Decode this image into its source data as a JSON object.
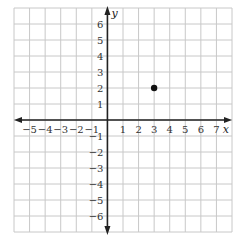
{
  "chart_data": {
    "type": "scatter",
    "title": "",
    "xlabel": "x",
    "ylabel": "y",
    "xlim": [
      -6,
      8
    ],
    "ylim": [
      -7,
      7
    ],
    "grid": true,
    "x_tick_labels": [
      "−5",
      "−4",
      "−3",
      "−2",
      "−1",
      "1",
      "2",
      "3",
      "4",
      "5",
      "6",
      "7"
    ],
    "x_ticks": [
      -5,
      -4,
      -3,
      -2,
      -1,
      1,
      2,
      3,
      4,
      5,
      6,
      7
    ],
    "y_tick_labels": [
      "6",
      "5",
      "4",
      "3",
      "2",
      "1",
      "−1",
      "−2",
      "−3",
      "−4",
      "−5",
      "−6"
    ],
    "y_ticks": [
      6,
      5,
      4,
      3,
      2,
      1,
      -1,
      -2,
      -3,
      -4,
      -5,
      -6
    ],
    "points": [
      {
        "x": 3,
        "y": 2
      }
    ],
    "colors": {
      "grid": "#c8c8c8",
      "axis": "#222222",
      "point": "#111111"
    }
  }
}
